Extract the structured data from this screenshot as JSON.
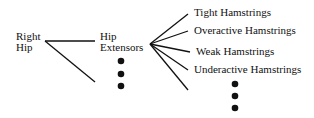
{
  "root": {
    "line1": "Right",
    "line2": "Hip"
  },
  "middle": {
    "line1": "Hip",
    "line2": "Extensors"
  },
  "leaves": [
    "Tight Hamstrings",
    "Overactive Hamstrings",
    "Weak Hamstrings",
    "Underactive Hamstrings"
  ]
}
